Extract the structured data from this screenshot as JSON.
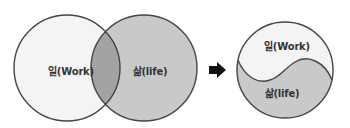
{
  "diagram": {
    "venn": {
      "work_label": "일(Work)",
      "life_label": "삶(life)"
    },
    "arrow": {
      "direction": "right"
    },
    "yin_yang": {
      "work_label": "일(Work)",
      "life_label": "삶(life)"
    },
    "colors": {
      "work_fill": "#f4f4f4",
      "life_fill": "#c9c9c9",
      "overlap_fill": "#a3a3a3",
      "stroke": "#454545",
      "arrow": "#111111"
    }
  }
}
